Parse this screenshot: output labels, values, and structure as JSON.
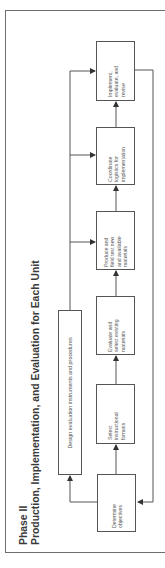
{
  "title": {
    "phase": "Phase II",
    "subtitle": "Production, Implementation, and Evaluation for Each Unit"
  },
  "boxes": [
    {
      "id": "determine",
      "label": "Determine\nobjectives"
    },
    {
      "id": "select",
      "label": "Select\ninstructional\nformats"
    },
    {
      "id": "evaluate",
      "label": "Evaluate and\nselect existing\nmaterials"
    },
    {
      "id": "produce",
      "label": "Produce and\nfield test new\nand available\nmaterials"
    },
    {
      "id": "coordinate",
      "label": "Coordinate\nlogistics for\nimplementation"
    },
    {
      "id": "implement",
      "label": "Implement,\nevaluate, and\nrevise"
    }
  ],
  "design_box": {
    "label": "Design evaluation instruments and procedures"
  },
  "colors": {
    "line": "#555555",
    "frame": "#6e6e6e",
    "text": "#3a3a3a"
  }
}
